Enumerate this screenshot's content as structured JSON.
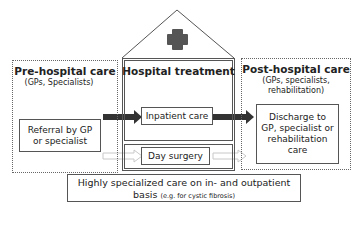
{
  "diagram": {
    "pre_hospital": {
      "title": "Pre-hospital care",
      "subtitle": "(GPs, Specialists)",
      "box": "Referral by GP or specialist",
      "box_line1": "Referral by GP",
      "box_line2": "or specialist"
    },
    "hospital": {
      "title": "Hospital treatment",
      "icon": "medical-cross-icon",
      "inpatient": "Inpatient care",
      "day_surgery": "Day surgery"
    },
    "post_hospital": {
      "title": "Post-hospital care",
      "subtitle_line1": "(GPs, specialists,",
      "subtitle_line2": "rehabilitation)",
      "box_line1": "Discharge to",
      "box_line2": "GP, specialist or",
      "box_line3": "rehabilitation",
      "box_line4": "care"
    },
    "specialized": {
      "line1": "Highly specialized care on in- and outpatient",
      "line2_main": "basis",
      "line2_note": "(e.g.  for cystic fibrosis)"
    },
    "arrows": [
      {
        "from": "Referral by GP or specialist",
        "to": "Inpatient care",
        "style": "solid-dark"
      },
      {
        "from": "Inpatient care",
        "to": "Discharge to GP, specialist or rehabilitation care",
        "style": "solid-dark"
      },
      {
        "from": "Pre-hospital care",
        "to": "Day surgery",
        "style": "hollow-light"
      },
      {
        "from": "Day surgery",
        "to": "Post-hospital care",
        "style": "hollow-light"
      }
    ],
    "colors": {
      "cross": "#555555",
      "arrow_dark": "#333333",
      "arrow_light": "#cccccc",
      "border": "#555555"
    }
  }
}
